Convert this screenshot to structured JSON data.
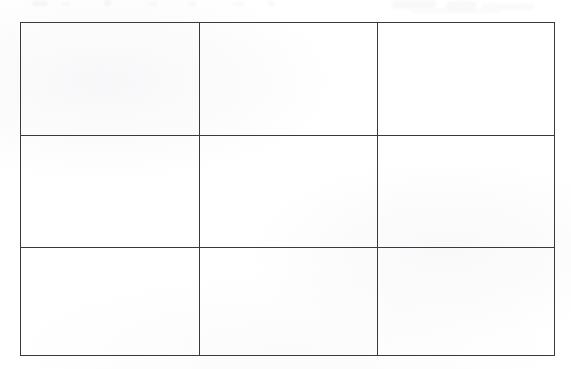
{
  "document": {
    "type": "scanned-page",
    "background_color": "#ffffff",
    "paper_tone": "#fefefe"
  },
  "table": {
    "name": "empty-grid-table",
    "rows": 3,
    "columns": 3,
    "border_color": "#3a3a3a",
    "border_width_px": 1.2,
    "bounds": {
      "left": 20,
      "top": 22,
      "width": 531,
      "height": 330
    },
    "column_dividers_x": [
      198,
      375
    ],
    "row_dividers_y": [
      134,
      245
    ],
    "column_widths_px": [
      178,
      177,
      176
    ],
    "row_heights_px": [
      112,
      111,
      107
    ],
    "cells": [
      [
        {
          "text": ""
        },
        {
          "text": ""
        },
        {
          "text": ""
        }
      ],
      [
        {
          "text": ""
        },
        {
          "text": ""
        },
        {
          "text": ""
        }
      ],
      [
        {
          "text": ""
        },
        {
          "text": ""
        },
        {
          "text": ""
        }
      ]
    ]
  },
  "artifacts": {
    "description": "faint scanner bleed-through marks along top edge",
    "color": "#e9e9ee",
    "region": {
      "left": 0,
      "top": 0,
      "width": 571,
      "height": 16
    }
  }
}
